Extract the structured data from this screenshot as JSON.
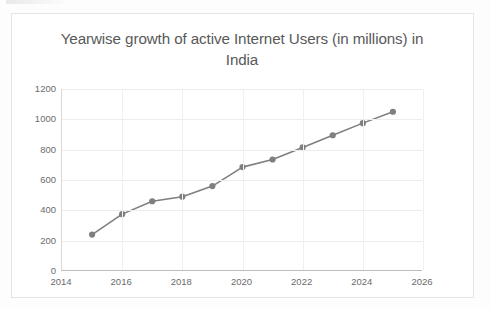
{
  "chart_data": {
    "type": "line",
    "title": "Yearwise growth of active Internet Users (in millions) in India",
    "title_line1": "Yearwise growth of active Internet Users (in",
    "title_line2": "millions) in India",
    "xlabel": "",
    "ylabel": "",
    "x": [
      2015,
      2016,
      2017,
      2018,
      2019,
      2020,
      2021,
      2022,
      2023,
      2024,
      2025
    ],
    "values": [
      240,
      375,
      460,
      490,
      560,
      685,
      735,
      815,
      895,
      975,
      1050
    ],
    "series": [
      {
        "name": "Active Internet Users (in millions)",
        "values": [
          240,
          375,
          460,
          490,
          560,
          685,
          735,
          815,
          895,
          975,
          1050
        ]
      }
    ],
    "xlim": [
      2014,
      2026
    ],
    "ylim": [
      0,
      1200
    ],
    "xticks": [
      2014,
      2016,
      2018,
      2020,
      2022,
      2024,
      2026
    ],
    "xtick_labels": [
      "2014",
      "2016",
      "2018",
      "2020",
      "2022",
      "2024",
      "2026"
    ],
    "yticks": [
      0,
      200,
      400,
      600,
      800,
      1000,
      1200
    ],
    "ytick_labels": [
      "0",
      "200",
      "400",
      "600",
      "800",
      "1000",
      "1200"
    ],
    "grid": true,
    "grid_axis": "both",
    "legend": false,
    "legend_position": "none",
    "marker": "circle",
    "colors": {
      "series": "#7f7f7f",
      "grid": "#ededed",
      "axis": "#bdbdbd",
      "text": "#5a5a5a",
      "background": "#ffffff"
    }
  }
}
